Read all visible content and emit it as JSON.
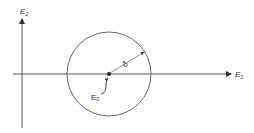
{
  "diagram": {
    "axes": {
      "x_label": "E",
      "x_label_sub": "1",
      "y_label": "E",
      "y_label_sub": "2"
    },
    "circle": {
      "center_label": "E",
      "center_label_sub": "0",
      "radius_label": "δ"
    },
    "colors": {
      "stroke": "#555555",
      "text": "#333333"
    }
  }
}
